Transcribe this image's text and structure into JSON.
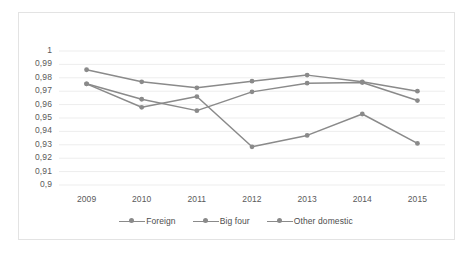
{
  "chart_data": {
    "type": "line",
    "title": "",
    "subtitle": "",
    "xlabel": "",
    "ylabel": "",
    "categories": [
      "2009",
      "2010",
      "2011",
      "2012",
      "2013",
      "2014",
      "2015"
    ],
    "series": [
      {
        "name": "Foreign",
        "color": "#8a8a8a",
        "values": [
          0.986,
          0.977,
          0.9725,
          0.9775,
          0.982,
          0.977,
          0.97
        ]
      },
      {
        "name": "Big four",
        "color": "#8a8a8a",
        "values": [
          0.9755,
          0.964,
          0.9555,
          0.9695,
          0.976,
          0.9765,
          0.963
        ]
      },
      {
        "name": "Other domestic",
        "color": "#8a8a8a",
        "values": [
          0.9755,
          0.958,
          0.966,
          0.9285,
          0.937,
          0.953,
          0.931
        ]
      }
    ],
    "ylim": [
      0.9,
      1.0
    ],
    "ytick_labels": [
      "1",
      "0,99",
      "0,98",
      "0,97",
      "0,96",
      "0,95",
      "0,94",
      "0,93",
      "0,92",
      "0,91",
      "0,9"
    ],
    "ytick_values": [
      1.0,
      0.99,
      0.98,
      0.97,
      0.96,
      0.95,
      0.94,
      0.93,
      0.92,
      0.91,
      0.9
    ],
    "grid": true,
    "grid_color": "#ededed",
    "legend_position": "bottom",
    "marker": "circle",
    "plot_background": "#ffffff",
    "border_color": "#e3e3e3"
  }
}
